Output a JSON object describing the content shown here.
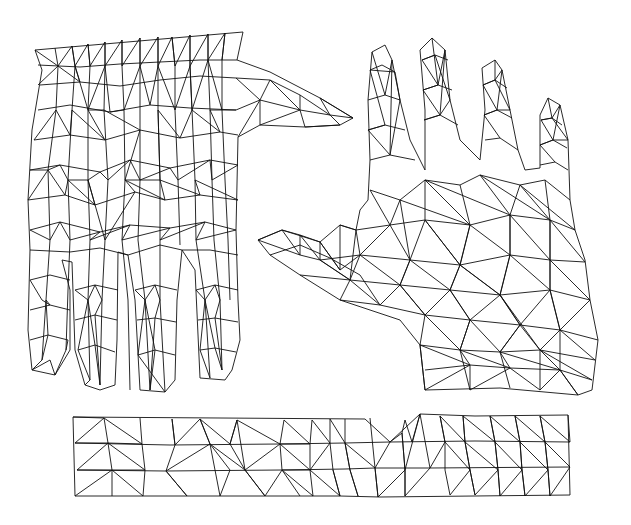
{
  "figure": {
    "description": "Triangulated surface meshes of a hand: back of hand (left), palm (right), and wrist/forearm strip (bottom)",
    "background": "#ffffff",
    "line_color": "#111111",
    "panels": [
      {
        "id": "back-of-hand",
        "label": "Back of hand mesh"
      },
      {
        "id": "palm",
        "label": "Palm mesh"
      },
      {
        "id": "wrist-strip",
        "label": "Wrist strip mesh"
      }
    ]
  }
}
